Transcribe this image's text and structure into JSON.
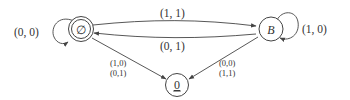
{
  "diagram": {
    "type": "state-transition-diagram",
    "nodes": [
      {
        "id": "empty",
        "label": "∅",
        "accepting": true
      },
      {
        "id": "B",
        "label": "B",
        "accepting": false
      },
      {
        "id": "zero",
        "label": "0",
        "underlined": true,
        "accepting": false
      }
    ],
    "edges": [
      {
        "from": "empty",
        "to": "empty",
        "label": "(0, 0)"
      },
      {
        "from": "empty",
        "to": "B",
        "label": "(1, 1)"
      },
      {
        "from": "B",
        "to": "empty",
        "label": "(0, 1)"
      },
      {
        "from": "B",
        "to": "B",
        "label": "(1, 0)"
      },
      {
        "from": "empty",
        "to": "zero",
        "label_lines": [
          "(1,0)",
          "(0,1)"
        ]
      },
      {
        "from": "B",
        "to": "zero",
        "label_lines": [
          "(0,0)",
          "(1,1)"
        ]
      }
    ]
  }
}
